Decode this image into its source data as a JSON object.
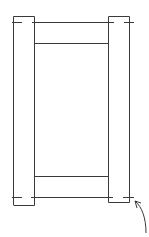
{
  "diagram": {
    "type": "frame-sketch",
    "description": "Hand-drawn door/frame elevation: two vertical stiles, top and bottom rails, with a curved arrow at bottom right",
    "stroke_color": "#3a3a3a",
    "background": "#ffffff",
    "parts": [
      {
        "name": "left-stile",
        "x": 13,
        "y": 16,
        "w": 22,
        "h": 189
      },
      {
        "name": "right-stile",
        "x": 108,
        "y": 16,
        "w": 22,
        "h": 186
      },
      {
        "name": "top-line",
        "x1": 12,
        "y1": 22,
        "x2": 134,
        "y2": 22
      },
      {
        "name": "top-rail-bottom",
        "x1": 35,
        "y1": 43,
        "x2": 108,
        "y2": 43
      },
      {
        "name": "bottom-rail-top",
        "x1": 35,
        "y1": 176,
        "x2": 108,
        "y2": 176
      },
      {
        "name": "bottom-line",
        "x1": 12,
        "y1": 197,
        "x2": 134,
        "y2": 197
      }
    ],
    "annotation": {
      "type": "curved-arrow",
      "points_to": "bottom-right-corner"
    }
  }
}
